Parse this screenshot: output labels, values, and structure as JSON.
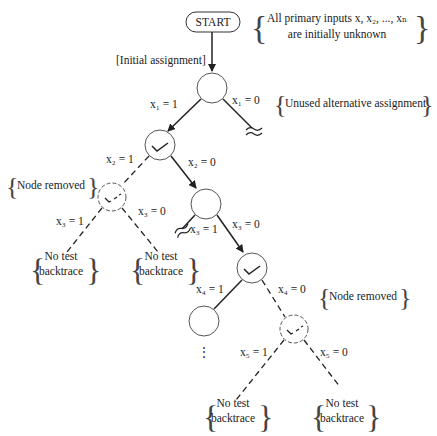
{
  "start": {
    "label": "START"
  },
  "notes": {
    "inputs_line1": "All primary inputs x, x₂, ..., xₙ",
    "inputs_line2": "are initially unknown",
    "initial_assignment": "[Initial assignment]",
    "unused_alt": "Unused alternative assignment",
    "node_removed_1": "Node removed",
    "node_removed_2": "Node removed",
    "no_test_1a": "No test",
    "no_test_1b": "backtrace",
    "no_test_2a": "No test",
    "no_test_2b": "backtrace",
    "no_test_3a": "No test",
    "no_test_3b": "backtrace",
    "no_test_4a": "No test",
    "no_test_4b": "backtrace"
  },
  "edges": {
    "x1_1": "x₁ = 1",
    "x1_0": "x₁ = 0",
    "x2_1": "x₂ = 1",
    "x2_0": "x₂ = 0",
    "x3_1_left": "x₃ = 1",
    "x3_0_left": "x₃ = 0",
    "x3_1_right": "x₃ = 1",
    "x3_0_right": "x₃ = 0",
    "x4_1": "x₄ = 1",
    "x4_0": "x₄ = 0",
    "x5_1": "x₅ = 1",
    "x5_0": "x₅ = 0"
  },
  "ellipsis": "⋮"
}
